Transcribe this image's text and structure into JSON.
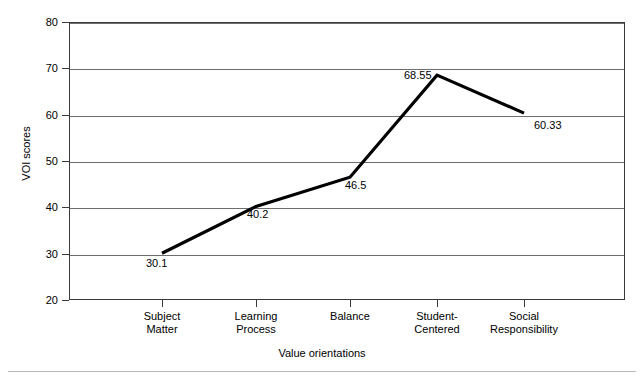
{
  "chart_data": {
    "type": "line",
    "title": "",
    "xlabel": "Value orientations",
    "ylabel": "VOI scores",
    "ylim": [
      20,
      80
    ],
    "yticks": [
      80,
      70,
      60,
      50,
      40,
      30,
      20
    ],
    "grid": true,
    "legend": false,
    "legend_position": "none",
    "line_color": "#000000",
    "categories": [
      "Subject\nMatter",
      "Learning\nProcess",
      "Balance",
      "Student-\nCentered",
      "Social\nResponsibility"
    ],
    "values": [
      30.1,
      40.2,
      46.5,
      68.55,
      60.33
    ],
    "point_labels": [
      "30.1",
      "40.2",
      "46.5",
      "68.55",
      "60.33"
    ]
  },
  "figure": {
    "caption": ""
  }
}
